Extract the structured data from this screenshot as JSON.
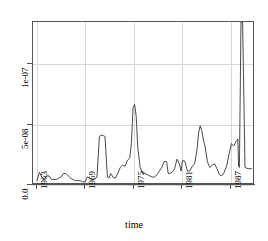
{
  "figure": {
    "background": "#ffffff",
    "frame_color": "#555555",
    "grid_color": "#d8d8d8",
    "series_color": "#333333"
  },
  "chart_data": {
    "type": "line",
    "title": "",
    "subtitle": "",
    "xlabel": "time",
    "ylabel": "",
    "grid": true,
    "legend": "none",
    "xlim": [
      1962.5,
      1990.0
    ],
    "ylim": [
      0.0,
      1.35e-07
    ],
    "xtick_labels": [
      "1963",
      "1969",
      "1975",
      "1981",
      "1987"
    ],
    "xtick_values": [
      1963,
      1969,
      1975,
      1981,
      1987
    ],
    "ytick_labels": [
      "0.0",
      "5e-08",
      "1e-07"
    ],
    "ytick_values": [
      0.0,
      5e-08,
      1e-07
    ],
    "annotations": [
      "spike near 1988 is clipped at the top of the panel"
    ],
    "series": [
      {
        "name": "rate",
        "x": [
          1963.0,
          1963.3,
          1963.6,
          1963.9,
          1964.2,
          1964.5,
          1964.8,
          1965.1,
          1965.4,
          1965.7,
          1966.0,
          1966.3,
          1966.6,
          1966.9,
          1967.2,
          1967.5,
          1967.8,
          1968.1,
          1968.4,
          1968.7,
          1969.0,
          1969.3,
          1969.6,
          1969.9,
          1970.2,
          1970.5,
          1970.8,
          1971.0,
          1971.2,
          1971.5,
          1971.8,
          1972.0,
          1972.2,
          1972.5,
          1972.8,
          1973.1,
          1973.4,
          1973.7,
          1974.0,
          1974.3,
          1974.6,
          1974.8,
          1975.0,
          1975.2,
          1975.4,
          1975.6,
          1975.9,
          1976.2,
          1976.5,
          1976.8,
          1977.1,
          1977.4,
          1977.7,
          1978.0,
          1978.3,
          1978.6,
          1978.9,
          1979.2,
          1979.4,
          1979.6,
          1979.9,
          1980.2,
          1980.5,
          1980.8,
          1981.0,
          1981.2,
          1981.5,
          1981.8,
          1982.1,
          1982.4,
          1982.7,
          1983.0,
          1983.2,
          1983.4,
          1983.6,
          1983.8,
          1984.0,
          1984.3,
          1984.6,
          1984.9,
          1985.2,
          1985.5,
          1985.8,
          1986.1,
          1986.4,
          1986.7,
          1987.0,
          1987.3,
          1987.6,
          1987.9,
          1988.0,
          1988.1,
          1988.2,
          1988.3,
          1988.5,
          1988.7,
          1989.0,
          1989.4,
          1989.8
        ],
        "y": [
          2e-09,
          9e-09,
          5e-09,
          3e-09,
          6e-09,
          6e-09,
          3e-09,
          3e-09,
          3e-09,
          4e-09,
          5e-09,
          8e-09,
          8e-09,
          6e-09,
          4e-09,
          3e-09,
          2e-09,
          2e-09,
          2e-09,
          1e-09,
          1e-09,
          5e-09,
          4e-09,
          3e-09,
          3e-09,
          5e-09,
          3.9e-08,
          4e-08,
          4e-08,
          3.9e-08,
          5e-09,
          4e-09,
          8e-09,
          5e-09,
          4e-09,
          8e-09,
          1.3e-08,
          1.5e-08,
          1.4e-08,
          1.9e-08,
          2.1e-08,
          3.3e-08,
          6.3e-08,
          6.6e-08,
          5.6e-08,
          2.9e-08,
          1.3e-08,
          8e-09,
          8e-09,
          7e-09,
          6e-09,
          5e-09,
          5e-09,
          7e-09,
          1e-08,
          1.3e-08,
          1.8e-08,
          1.8e-08,
          8e-09,
          8e-09,
          9e-09,
          1.2e-08,
          2e-08,
          1.6e-08,
          1e-08,
          1.9e-08,
          1.8e-08,
          1e-08,
          1e-08,
          1.4e-08,
          1.6e-08,
          2.8e-08,
          4.2e-08,
          4.8e-08,
          4.4e-08,
          3.6e-08,
          3.1e-08,
          1.8e-08,
          1.3e-08,
          1.5e-08,
          1.6e-08,
          1.2e-08,
          7e-09,
          6e-09,
          9e-09,
          1.4e-08,
          2.4e-08,
          3.3e-08,
          3.1e-08,
          3.5e-08,
          3.6e-08,
          3.7e-08,
          1.4e-08,
          1.3e-08,
          1.35e-07,
          1.35e-07,
          1.3e-08,
          1.2e-08,
          1.2e-08
        ]
      }
    ]
  }
}
